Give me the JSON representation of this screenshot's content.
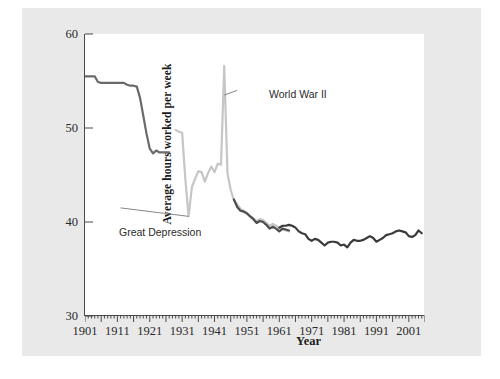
{
  "figure": {
    "background_color": "#e9e9e9",
    "plot_background_color": "#ffffff",
    "axis_color": "#4a4a4a"
  },
  "axis": {
    "y_title": "Average hours worked per week",
    "x_title": "Year",
    "y_ticks": [
      30,
      40,
      50,
      60
    ],
    "x_ticks": [
      1901,
      1911,
      1921,
      1931,
      1941,
      1951,
      1961,
      1971,
      1981,
      1991,
      2001
    ]
  },
  "annotations": [
    {
      "name": "great-depression",
      "text": "Great Depression"
    },
    {
      "name": "world-war-ii",
      "text": "World War II"
    }
  ],
  "chart_data": {
    "type": "line",
    "title": "",
    "xlabel": "Year",
    "ylabel": "Average hours worked per week",
    "xlim": [
      1901,
      2006
    ],
    "ylim": [
      30,
      60
    ],
    "y_ticks": [
      30,
      40,
      50,
      60
    ],
    "x_ticks": [
      1901,
      1911,
      1921,
      1931,
      1941,
      1951,
      1961,
      1971,
      1981,
      1991,
      2001
    ],
    "x_minor_tick_interval": 1,
    "x_major_tick_interval": 5,
    "grid": false,
    "legend": "none",
    "annotations": [
      {
        "text": "Great Depression",
        "points_to": {
          "x": 1933,
          "y": 40.6
        },
        "label_at": {
          "x": 1912,
          "y": 41.5
        }
      },
      {
        "text": "World War II",
        "points_to": {
          "x": 1944,
          "y": 53.5
        },
        "label_at": {
          "x": 1948,
          "y": 54.0
        }
      }
    ],
    "series": [
      {
        "name": "Series 1 (early, dark gray)",
        "color": "#6a6a6a",
        "linewidth": 2.2,
        "x": [
          1901,
          1904,
          1905,
          1906,
          1907,
          1908,
          1909,
          1913,
          1914,
          1915,
          1916,
          1917,
          1918,
          1919,
          1920,
          1921,
          1922,
          1923,
          1924,
          1925,
          1926,
          1927
        ],
        "y": [
          55.5,
          55.5,
          54.9,
          54.8,
          54.8,
          54.8,
          54.8,
          54.8,
          54.6,
          54.5,
          54.5,
          54.4,
          53.2,
          51.3,
          49.4,
          47.8,
          47.3,
          47.6,
          47.4,
          47.4,
          47.4,
          47.4
        ]
      },
      {
        "name": "Series 2 (Depression & WWII, light gray)",
        "color": "#c6c6c6",
        "linewidth": 2.2,
        "x": [
          1929,
          1930,
          1931,
          1932,
          1933,
          1934,
          1935,
          1936,
          1937,
          1938,
          1939,
          1940,
          1941,
          1942,
          1943,
          1944,
          1945,
          1946,
          1947,
          1948,
          1949,
          1950,
          1951,
          1952,
          1953,
          1954,
          1955,
          1956,
          1957,
          1958,
          1959,
          1960,
          1961,
          1962,
          1963,
          1964
        ],
        "y": [
          49.8,
          49.6,
          49.5,
          44.5,
          40.6,
          43.7,
          44.6,
          45.4,
          45.3,
          44.3,
          45.2,
          45.9,
          45.3,
          46.2,
          46.1,
          56.6,
          45.2,
          43.4,
          42.3,
          41.9,
          41.4,
          41.2,
          41.0,
          40.6,
          40.4,
          40.1,
          40.3,
          40.2,
          39.9,
          39.6,
          39.8,
          39.6,
          39.4,
          39.2,
          39.1,
          39.0
        ]
      },
      {
        "name": "Series 3 (postwar, dark gray)",
        "color": "#4d4d4d",
        "linewidth": 2.2,
        "x": [
          1947,
          1948,
          1949,
          1950,
          1951,
          1952,
          1953,
          1954,
          1955,
          1956,
          1957,
          1958,
          1959,
          1960,
          1961,
          1962,
          1963,
          1964
        ],
        "y": [
          42.4,
          41.6,
          41.2,
          41.1,
          40.9,
          40.6,
          40.3,
          39.9,
          40.1,
          40.0,
          39.7,
          39.3,
          39.5,
          39.3,
          39.0,
          39.3,
          39.2,
          39.1
        ]
      },
      {
        "name": "Series 4 (modern, dark gray)",
        "color": "#3a3a3a",
        "linewidth": 2.2,
        "x": [
          1961,
          1962,
          1963,
          1964,
          1965,
          1966,
          1967,
          1968,
          1969,
          1970,
          1971,
          1972,
          1973,
          1974,
          1975,
          1976,
          1977,
          1978,
          1979,
          1980,
          1981,
          1982,
          1983,
          1984,
          1985,
          1986,
          1987,
          1988,
          1989,
          1990,
          1991,
          1992,
          1993,
          1994,
          1995,
          1996,
          1997,
          1998,
          1999,
          2000,
          2001,
          2002,
          2003,
          2004,
          2005
        ],
        "y": [
          39.4,
          39.6,
          39.6,
          39.7,
          39.6,
          39.4,
          39.0,
          38.8,
          38.7,
          38.2,
          38.0,
          38.2,
          38.1,
          37.8,
          37.5,
          37.8,
          37.9,
          37.9,
          37.8,
          37.5,
          37.6,
          37.3,
          37.8,
          38.1,
          38.0,
          38.0,
          38.1,
          38.3,
          38.5,
          38.3,
          37.9,
          38.1,
          38.3,
          38.6,
          38.7,
          38.8,
          39.0,
          39.1,
          39.0,
          38.9,
          38.5,
          38.4,
          38.6,
          39.1,
          38.8
        ]
      }
    ]
  }
}
